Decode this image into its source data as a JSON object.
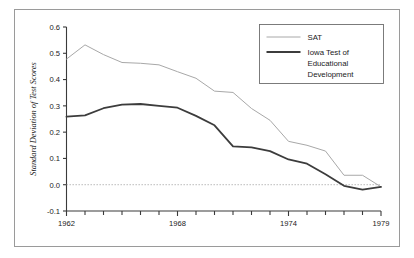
{
  "figure": {
    "frame_color": "#9a9a9a",
    "background": "#ffffff"
  },
  "chart_data": {
    "type": "line",
    "title": "",
    "subtitle": "",
    "xlabel": "",
    "ylabel": "Standard Deviation of Test Scores",
    "xlim": [
      1962,
      1979
    ],
    "ylim": [
      -0.1,
      0.6
    ],
    "grid": false,
    "legend_position": "top-right",
    "zero_reference_line": {
      "value": 0.0,
      "style": "dotted",
      "color": "#b4b4b4"
    },
    "x": [
      1962,
      1963,
      1964,
      1965,
      1966,
      1967,
      1968,
      1969,
      1970,
      1971,
      1972,
      1973,
      1974,
      1975,
      1976,
      1977,
      1978,
      1979
    ],
    "x_tick_labels": [
      "1962",
      "1968",
      "1974",
      "1979"
    ],
    "x_tick_label_values": [
      1962,
      1968,
      1974,
      1979
    ],
    "y_tick_labels": [
      "0.6",
      "0.5",
      "0.4",
      "0.3",
      "0.2",
      "0.1",
      "0.0",
      "-0.1"
    ],
    "y_tick_values": [
      0.6,
      0.5,
      0.4,
      0.3,
      0.2,
      0.1,
      0.0,
      -0.1
    ],
    "series": [
      {
        "name": "SAT",
        "color": "#a8a8a8",
        "width": 1.0,
        "values": [
          0.478,
          0.532,
          0.495,
          0.465,
          0.462,
          0.456,
          0.43,
          0.405,
          0.356,
          0.351,
          0.29,
          0.245,
          0.165,
          0.15,
          0.128,
          0.036,
          0.036,
          -0.008
        ]
      },
      {
        "name": "Iowa Test of Educational Development",
        "color": "#3c3c3c",
        "width": 1.8,
        "values": [
          0.259,
          0.264,
          0.291,
          0.305,
          0.307,
          0.3,
          0.293,
          0.262,
          0.226,
          0.146,
          0.142,
          0.128,
          0.096,
          0.08,
          0.04,
          -0.004,
          -0.019,
          -0.008
        ]
      }
    ]
  },
  "legend": {
    "entries": [
      {
        "label": "SAT",
        "color": "#a8a8a8"
      },
      {
        "label": "Iowa Test of",
        "color": "#3c3c3c"
      },
      {
        "label": "Educational",
        "color": "#3c3c3c"
      },
      {
        "label": "Development",
        "color": "#3c3c3c"
      }
    ],
    "border_color": "#6e6e6e"
  }
}
